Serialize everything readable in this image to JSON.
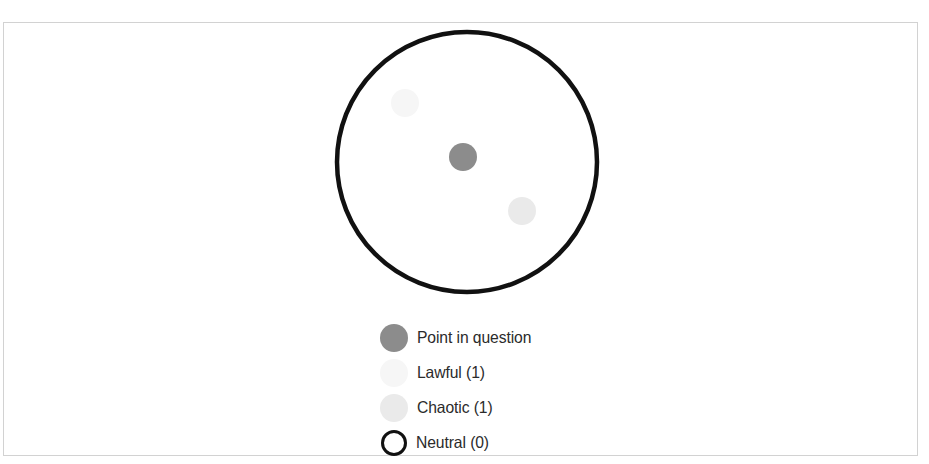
{
  "figure": {
    "background_color": "#ffffff",
    "frame_color": "#d2d2d2"
  },
  "chart_data": {
    "type": "scatter",
    "title": "",
    "subtitle": "",
    "xlabel": "",
    "ylabel": "",
    "grid": false,
    "axes_visible": false,
    "legend_position": "bottom-center",
    "boundary": {
      "name": "neutral-boundary-circle",
      "shape": "circle",
      "cx": 467,
      "cy": 162,
      "r": 130,
      "stroke": "#111111",
      "stroke_width": 4.5,
      "fill": "none"
    },
    "points": [
      {
        "name": "point-in-question",
        "label": "Point in question",
        "cx": 463,
        "cy": 157,
        "r": 14,
        "color": "#8c8c8c"
      },
      {
        "name": "lawful-point",
        "label": "Lawful (1)",
        "cx": 405,
        "cy": 103,
        "r": 14,
        "color": "#f6f6f6"
      },
      {
        "name": "chaotic-point",
        "label": "Chaotic (1)",
        "cx": 522,
        "cy": 211,
        "r": 14,
        "color": "#eaeaea"
      }
    ],
    "legend": [
      {
        "key": "point-in-question",
        "label": "Point in question",
        "marker": "filled-circle",
        "color": "#8c8c8c",
        "count": null
      },
      {
        "key": "lawful",
        "label": "Lawful (1)",
        "marker": "filled-circle",
        "color": "#f6f6f6",
        "count": 1
      },
      {
        "key": "chaotic",
        "label": "Chaotic (1)",
        "marker": "filled-circle",
        "color": "#eaeaea",
        "count": 1
      },
      {
        "key": "neutral",
        "label": "Neutral (0)",
        "marker": "open-circle",
        "color": "#111111",
        "count": 0
      }
    ]
  }
}
